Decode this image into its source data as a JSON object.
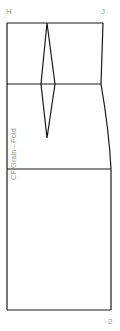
{
  "diagram": {
    "type": "sewing-pattern-skirt-block",
    "point_labels": {
      "left_top": "H",
      "right_top": "J"
    },
    "fold_label": "CF Grain - Fold",
    "page_number": "2",
    "colors": {
      "line": "#1a1a1a",
      "text": "#9a9a9a",
      "background": "#ffffff"
    },
    "lines": {
      "waist_y": 23,
      "waist_mark_y": 84,
      "hip_y": 169,
      "hem_y": 310
    },
    "dart": {
      "apex_top": [
        47,
        23
      ],
      "left": [
        41,
        84
      ],
      "right": [
        55,
        84
      ],
      "tip": [
        47,
        138
      ]
    }
  }
}
